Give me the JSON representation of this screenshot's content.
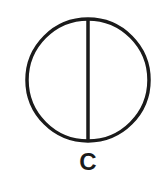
{
  "diagram": {
    "shape": "circle-with-vertical-diameter",
    "label": "C",
    "stroke_color": "#1a1a1a",
    "background_color": "#ffffff",
    "circle": {
      "cx": 88,
      "cy": 80,
      "r": 61,
      "stroke_width": 3.5
    },
    "divider": {
      "x": 88,
      "y1": 19,
      "y2": 141,
      "stroke_width": 3.5
    }
  }
}
